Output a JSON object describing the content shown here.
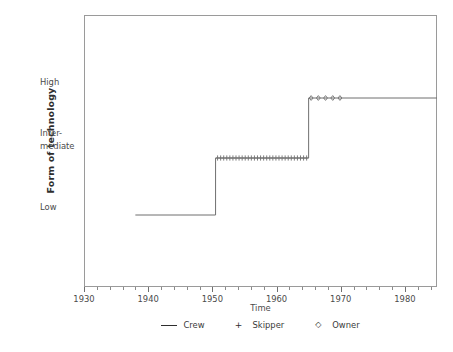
{
  "chart_data": {
    "type": "line",
    "title": "",
    "xlabel": "Time",
    "ylabel": "Form of technology",
    "xlim": [
      1930,
      1985
    ],
    "ylim": [
      0,
      3
    ],
    "grid": false,
    "legend_position": "bottom",
    "x_tick_labels": [
      "1930",
      "1940",
      "1950",
      "1960",
      "1970",
      "1980"
    ],
    "x_tick_values": [
      1930,
      1940,
      1950,
      1960,
      1970,
      1980
    ],
    "x_minor_tick_step": 2,
    "y_tick_labels": [
      "High",
      "Inter-",
      "mediate",
      "Low"
    ],
    "y_categories": [
      "Low",
      "Intermediate",
      "High"
    ],
    "series": [
      {
        "name": "Crew",
        "marker": "line",
        "level": "Low",
        "x": [
          1938,
          1950.5
        ],
        "y": [
          1,
          1
        ]
      },
      {
        "name": "Skipper",
        "marker": "+",
        "level": "Intermediate",
        "x": [
          1950.5,
          1965
        ],
        "y": [
          2,
          2
        ],
        "marker_count": 30
      },
      {
        "name": "Owner",
        "marker": "diamond",
        "level": "High",
        "x": [
          1965,
          1985
        ],
        "y": [
          3,
          3
        ],
        "marker_count": 5
      }
    ],
    "steps": [
      {
        "from_level": "Low",
        "to_level": "Intermediate",
        "x": 1950.5
      },
      {
        "from_level": "Intermediate",
        "to_level": "High",
        "x": 1965
      }
    ]
  },
  "axes": {
    "y_title": "Form of technology",
    "x_title": "Time",
    "y_labels": {
      "high": "High",
      "intermediate_line1": "Inter-",
      "intermediate_line2": "mediate",
      "low": "Low"
    },
    "x_labels": [
      "1930",
      "1940",
      "1950",
      "1960",
      "1970",
      "1980"
    ]
  },
  "legend": {
    "entries": [
      {
        "label": "Crew",
        "marker": "line",
        "glyph": "—"
      },
      {
        "label": "Skipper",
        "marker": "plus",
        "glyph": "+"
      },
      {
        "label": "Owner",
        "marker": "diamond",
        "glyph": "◇"
      }
    ]
  },
  "colors": {
    "line": "#6f6f6f",
    "frame": "#9a9a9a",
    "text": "#3a3a3a",
    "background": "#ffffff"
  }
}
